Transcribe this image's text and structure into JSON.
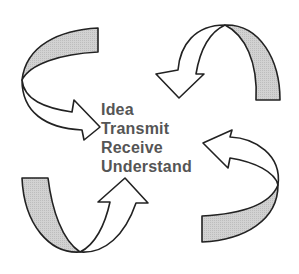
{
  "diagram": {
    "type": "cycle",
    "steps": [
      {
        "label": "Idea"
      },
      {
        "label": "Transmit"
      },
      {
        "label": "Receive"
      },
      {
        "label": "Understand"
      }
    ],
    "arrows": [
      {
        "position": "top-left",
        "direction": "clockwise",
        "points_to": "right"
      },
      {
        "position": "top-right",
        "direction": "clockwise",
        "points_to": "down"
      },
      {
        "position": "bottom-right",
        "direction": "clockwise",
        "points_to": "left"
      },
      {
        "position": "bottom-left",
        "direction": "clockwise",
        "points_to": "up"
      }
    ],
    "colors": {
      "band_fill": "#cccccc",
      "arrow_fill": "#ffffff",
      "stroke": "#222222",
      "text": "#555555"
    }
  }
}
